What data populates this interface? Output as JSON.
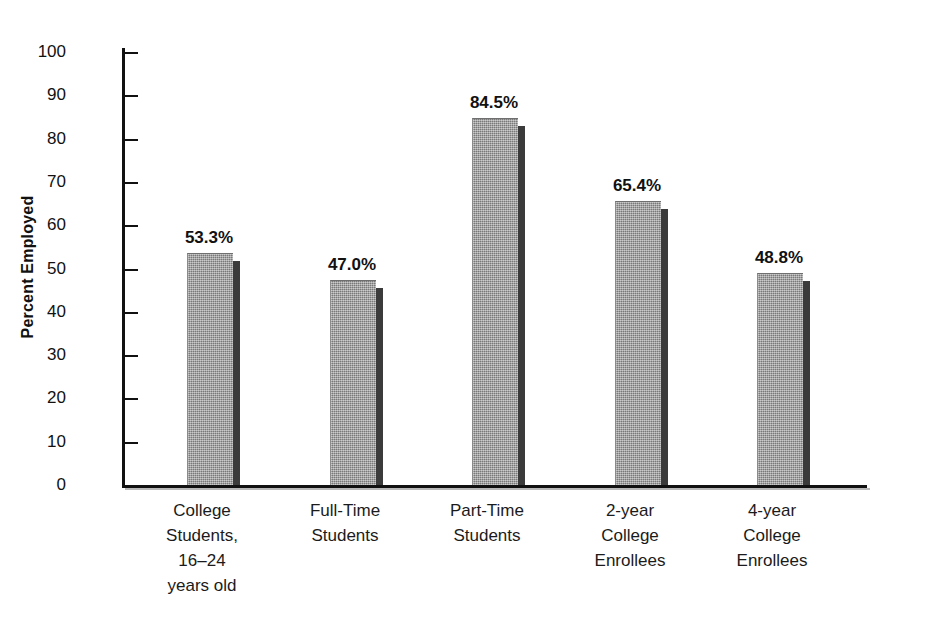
{
  "chart_data": {
    "type": "bar",
    "title": "",
    "xlabel": "",
    "ylabel": "Percent Employed",
    "ylim": [
      0,
      100
    ],
    "yticks": [
      0,
      10,
      20,
      30,
      40,
      50,
      60,
      70,
      80,
      90,
      100
    ],
    "ytick_labels": [
      "0",
      "10",
      "20",
      "30",
      "40",
      "50",
      "60",
      "70",
      "80",
      "90",
      "100"
    ],
    "grid": false,
    "legend": "none",
    "categories": [
      "College Students, 16–24 years old",
      "Full-Time Students",
      "Part-Time Students",
      "2-year College Enrollees",
      "4-year College Enrollees"
    ],
    "values": [
      53.3,
      47.0,
      84.5,
      65.4,
      48.8
    ],
    "value_labels": [
      "53.3%",
      "47.0%",
      "84.5%",
      "65.4%",
      "48.8%"
    ],
    "bar_color": "#9a9a9a",
    "bar_shadow_color": "#3b3b3b",
    "axis_color": "#111111"
  },
  "axis": {
    "y_title": "Percent Employed"
  },
  "categories": [
    {
      "id": "college-students",
      "lines": [
        "College",
        "Students,",
        "16–24",
        "years old"
      ],
      "value_label": "53.3%"
    },
    {
      "id": "full-time-students",
      "lines": [
        "Full-Time",
        "Students",
        "",
        ""
      ],
      "value_label": "47.0%"
    },
    {
      "id": "part-time-students",
      "lines": [
        "Part-Time",
        "Students",
        "",
        ""
      ],
      "value_label": "84.5%"
    },
    {
      "id": "two-year-college-enrollees",
      "lines": [
        "2-year",
        "College",
        "Enrollees",
        ""
      ],
      "value_label": "65.4%"
    },
    {
      "id": "four-year-college-enrollees",
      "lines": [
        "4-year",
        "College",
        "Enrollees",
        ""
      ],
      "value_label": "48.8%"
    }
  ],
  "ticks": [
    {
      "label": "100"
    },
    {
      "label": "90"
    },
    {
      "label": "80"
    },
    {
      "label": "70"
    },
    {
      "label": "60"
    },
    {
      "label": "50"
    },
    {
      "label": "40"
    },
    {
      "label": "30"
    },
    {
      "label": "20"
    },
    {
      "label": "10"
    },
    {
      "label": "0"
    }
  ]
}
